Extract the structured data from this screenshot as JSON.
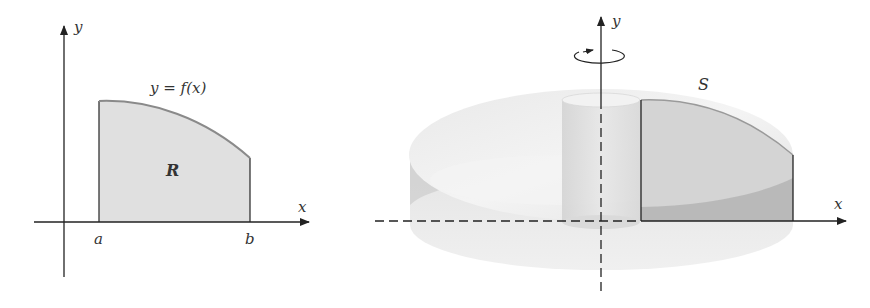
{
  "figure_left": {
    "title": "Region R under y = f(x) on [a, b]",
    "axis_x_label": "x",
    "axis_y_label": "y",
    "curve_label": "y = f(x)",
    "region_label": "R",
    "tick_a": "a",
    "tick_b": "b"
  },
  "figure_right": {
    "title": "Solid S obtained by rotating R about the y-axis",
    "axis_x_label": "x",
    "axis_y_label": "y",
    "solid_label": "S",
    "rotation_icon": "rotation-arrow-icon"
  },
  "colors": {
    "axis": "#222222",
    "region_fill": "#e0e0e0",
    "curve": "#8a8a8a",
    "solid_light": "#ececec",
    "solid_mid": "#d6d6d6",
    "solid_dark": "#a8a8a8",
    "text": "#333333"
  }
}
